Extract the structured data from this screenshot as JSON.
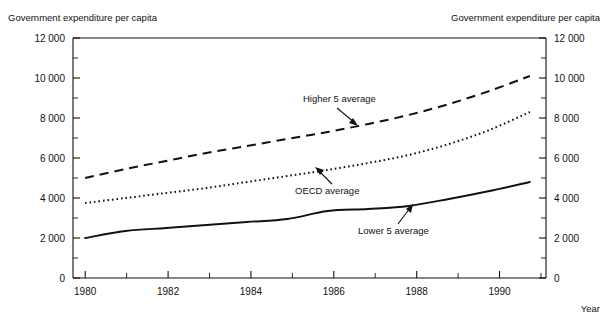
{
  "chart_data": {
    "type": "line",
    "title": "Government expenditure per capita",
    "title_left": "Government expenditure per capita",
    "title_right": "Government expenditure per capita",
    "xlabel": "Year",
    "ylabel": "",
    "xlim": [
      1979.7,
      1991.4
    ],
    "ylim": [
      0,
      12000
    ],
    "grid": false,
    "legend_position": "inline-annotations",
    "x_tick_labels": [
      "1980",
      "1982",
      "1984",
      "1986",
      "1988",
      "1990"
    ],
    "x_tick_values": [
      1980,
      1982,
      1984,
      1986,
      1988,
      1990
    ],
    "x_minor_tick_values": [
      1981,
      1983,
      1985,
      1987,
      1989,
      1991
    ],
    "y_tick_labels": [
      "0",
      "2 000",
      "4 000",
      "6 000",
      "8 000",
      "10 000",
      "12 000"
    ],
    "y_tick_values": [
      0,
      2000,
      4000,
      6000,
      8000,
      10000,
      12000
    ],
    "y_minor_tick_values": [
      1000,
      3000,
      5000,
      7000,
      9000,
      11000
    ],
    "x": [
      1980,
      1981,
      1982,
      1983,
      1984,
      1985,
      1986,
      1987,
      1988,
      1989,
      1990,
      1991
    ],
    "series": [
      {
        "name": "Higher 5 average",
        "style": "dashed",
        "values": [
          5000,
          5450,
          5850,
          6250,
          6600,
          6950,
          7300,
          7700,
          8150,
          8700,
          9350,
          10100
        ]
      },
      {
        "name": "OECD average",
        "style": "dotted",
        "values": [
          3750,
          4000,
          4250,
          4500,
          4800,
          5100,
          5400,
          5750,
          6150,
          6700,
          7400,
          8300
        ]
      },
      {
        "name": "Lower 5 average",
        "style": "solid",
        "values": [
          2000,
          2350,
          2500,
          2650,
          2800,
          2950,
          3350,
          3450,
          3600,
          3950,
          4350,
          4800
        ]
      }
    ],
    "annotations": [
      {
        "text": "Higher 5 average",
        "series": "Higher 5 average",
        "target_x": 1987,
        "target_y": 7700
      },
      {
        "text": "OECD average",
        "series": "OECD average",
        "target_x": 1986,
        "target_y": 5400
      },
      {
        "text": "Lower 5 average",
        "series": "Lower 5 average",
        "target_x": 1988,
        "target_y": 3600
      }
    ]
  }
}
